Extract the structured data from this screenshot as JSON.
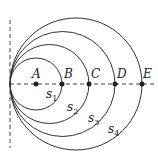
{
  "diagram": {
    "points": [
      {
        "label": "A",
        "x": 36
      },
      {
        "label": "B",
        "x": 62
      },
      {
        "label": "C",
        "x": 89
      },
      {
        "label": "D",
        "x": 115
      },
      {
        "label": "E",
        "x": 142
      }
    ],
    "curves": [
      {
        "label": "s",
        "sub": "1"
      },
      {
        "label": "s",
        "sub": "2"
      },
      {
        "label": "s",
        "sub": "3"
      },
      {
        "label": "s",
        "sub": "4"
      }
    ]
  }
}
